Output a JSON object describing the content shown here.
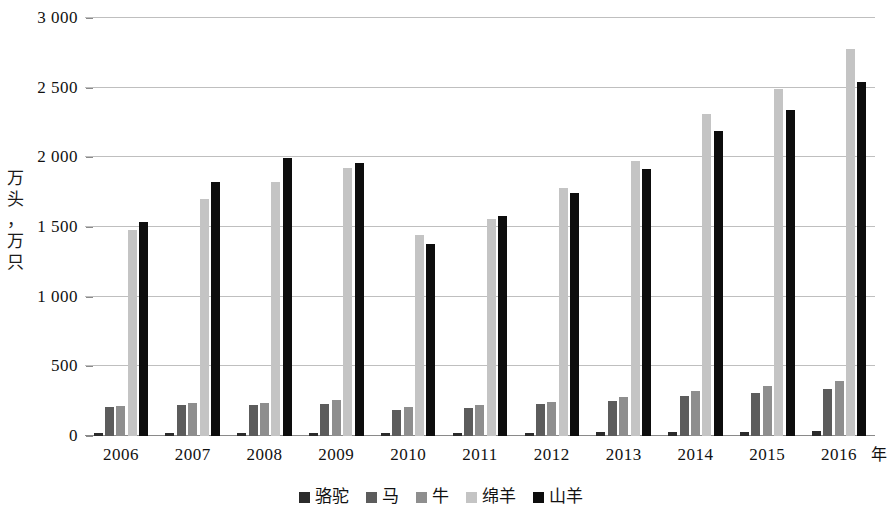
{
  "chart_data": {
    "type": "bar",
    "title": "",
    "subtitle": "",
    "xlabel": "年",
    "ylabel": "万头，万只",
    "ylabel_chars": [
      "万",
      "头",
      "，",
      "万",
      "只"
    ],
    "categories": [
      "2006",
      "2007",
      "2008",
      "2009",
      "2010",
      "2011",
      "2012",
      "2013",
      "2014",
      "2015",
      "2016"
    ],
    "ylim": [
      0,
      3000
    ],
    "ytick_values": [
      0,
      500,
      1000,
      1500,
      2000,
      2500,
      3000
    ],
    "ytick_labels": [
      "0",
      "500",
      "1 000",
      "1 500",
      "2 000",
      "2 500",
      "3 000"
    ],
    "grid": true,
    "legend_position": "bottom",
    "series": [
      {
        "name": "骆驼",
        "color": "#2b2b2b",
        "values": [
          25,
          25,
          25,
          25,
          25,
          25,
          25,
          28,
          30,
          32,
          35
        ]
      },
      {
        "name": "马",
        "color": "#5c5c5c",
        "values": [
          205,
          220,
          225,
          230,
          190,
          200,
          230,
          250,
          285,
          310,
          340
        ]
      },
      {
        "name": "牛",
        "color": "#8e8e8e",
        "values": [
          215,
          235,
          240,
          255,
          205,
          220,
          245,
          280,
          325,
          360,
          395
        ]
      },
      {
        "name": "绵羊",
        "color": "#c4c4c4",
        "values": [
          1480,
          1700,
          1825,
          1925,
          1440,
          1560,
          1780,
          1975,
          2310,
          2490,
          2775
        ]
      },
      {
        "name": "山羊",
        "color": "#0d0d0d",
        "values": [
          1535,
          1825,
          1995,
          1960,
          1380,
          1580,
          1745,
          1915,
          2190,
          2340,
          2540
        ]
      }
    ]
  },
  "legend": {
    "items": [
      {
        "label": "骆驼",
        "color": "#2b2b2b"
      },
      {
        "label": "马",
        "color": "#5c5c5c"
      },
      {
        "label": "牛",
        "color": "#8e8e8e"
      },
      {
        "label": "绵羊",
        "color": "#c4c4c4"
      },
      {
        "label": "山羊",
        "color": "#0d0d0d"
      }
    ]
  },
  "axis": {
    "y_title": "万头，万只",
    "x_unit": "年"
  }
}
